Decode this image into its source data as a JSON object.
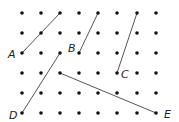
{
  "grid": {
    "columns_x": [
      22,
      41,
      60,
      79,
      98,
      117,
      137,
      156
    ],
    "rows_y": [
      13,
      33,
      53,
      73,
      93,
      113
    ],
    "dot_color": "#111111",
    "dot_radius": 1.8
  },
  "segments": [
    {
      "label": "A",
      "from": [
        22,
        53
      ],
      "to": [
        60,
        13
      ],
      "label_pos": [
        8,
        58
      ]
    },
    {
      "label": "B",
      "from": [
        79,
        53
      ],
      "to": [
        98,
        13
      ],
      "label_pos": [
        68,
        52
      ]
    },
    {
      "label": "C",
      "from": [
        117,
        73
      ],
      "to": [
        137,
        13
      ],
      "label_pos": [
        121,
        78
      ]
    },
    {
      "label": "D",
      "from": [
        22,
        113
      ],
      "to": [
        60,
        53
      ],
      "label_pos": [
        9,
        119
      ]
    },
    {
      "label": "E",
      "from": [
        60,
        73
      ],
      "to": [
        156,
        113
      ],
      "label_pos": [
        164,
        118
      ]
    }
  ],
  "line_color": "#555555"
}
